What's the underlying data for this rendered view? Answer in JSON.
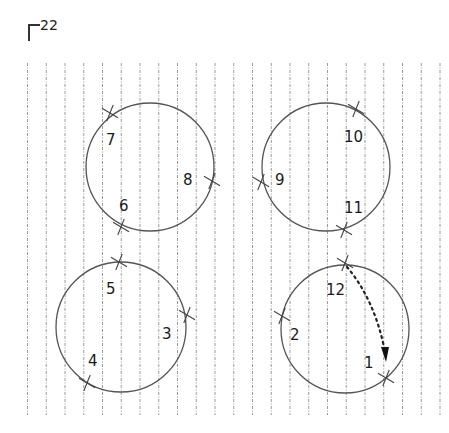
{
  "figure": {
    "label": "22",
    "grid": {
      "x_start": 27.5,
      "spacing": 18.75,
      "count": 23,
      "y_top": 63,
      "y_bottom": 415,
      "color": "#9a9a9a"
    },
    "circles": [
      {
        "name": "top-left",
        "cx": 150,
        "cy": 167,
        "r": 64
      },
      {
        "name": "top-right",
        "cx": 326,
        "cy": 167,
        "r": 64
      },
      {
        "name": "bottom-left",
        "cx": 121,
        "cy": 327,
        "r": 65
      },
      {
        "name": "bottom-right",
        "cx": 345,
        "cy": 329,
        "r": 64
      }
    ],
    "points": [
      {
        "n": "1",
        "x": 386,
        "y": 378,
        "lx": 364,
        "ly": 368
      },
      {
        "n": "2",
        "x": 282,
        "y": 316,
        "lx": 290,
        "ly": 340
      },
      {
        "n": "3",
        "x": 187,
        "y": 315,
        "lx": 162,
        "ly": 339
      },
      {
        "n": "4",
        "x": 87,
        "y": 383,
        "lx": 88,
        "ly": 366
      },
      {
        "n": "5",
        "x": 119,
        "y": 262,
        "lx": 106,
        "ly": 294
      },
      {
        "n": "6",
        "x": 121,
        "y": 227,
        "lx": 119,
        "ly": 211
      },
      {
        "n": "7",
        "x": 110,
        "y": 113,
        "lx": 106,
        "ly": 145
      },
      {
        "n": "8",
        "x": 212,
        "y": 181,
        "lx": 183,
        "ly": 185
      },
      {
        "n": "9",
        "x": 261,
        "y": 182,
        "lx": 275,
        "ly": 185
      },
      {
        "n": "10",
        "x": 356,
        "y": 109,
        "lx": 344,
        "ly": 142
      },
      {
        "n": "11",
        "x": 344,
        "y": 230,
        "lx": 344,
        "ly": 213
      },
      {
        "n": "12",
        "x": 345,
        "y": 263,
        "lx": 326,
        "ly": 295
      }
    ],
    "arrow": {
      "from": "12",
      "to": "1",
      "style": "dotted"
    }
  }
}
